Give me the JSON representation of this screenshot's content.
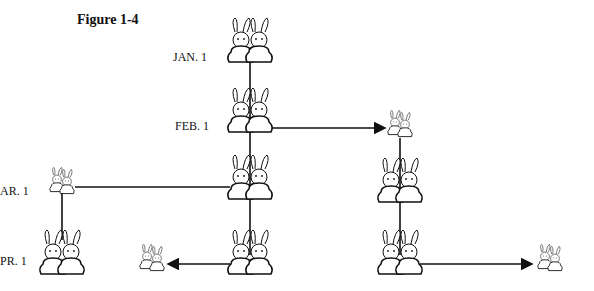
{
  "figure": {
    "title": "Figure 1-4",
    "labels": [
      "JAN. 1",
      "FEB. 1",
      "AR. 1",
      "PR. 1"
    ]
  },
  "nodes": [
    {
      "id": "jan-adult-pair",
      "x": 250,
      "y": 42,
      "type": "adult"
    },
    {
      "id": "feb-adult-pair",
      "x": 250,
      "y": 110,
      "type": "adult-mating"
    },
    {
      "id": "feb-baby-pair",
      "x": 400,
      "y": 128,
      "type": "baby"
    },
    {
      "id": "mar-adult-pair",
      "x": 250,
      "y": 175,
      "type": "adult-mating"
    },
    {
      "id": "mar-baby-pair",
      "x": 65,
      "y": 187,
      "type": "baby"
    },
    {
      "id": "mar-grown-pair",
      "x": 400,
      "y": 178,
      "type": "adult"
    },
    {
      "id": "apr-adult-pair-a",
      "x": 250,
      "y": 255,
      "type": "adult-mating"
    },
    {
      "id": "apr-grown-pair-left",
      "x": 62,
      "y": 252,
      "type": "adult"
    },
    {
      "id": "apr-baby-pair-left",
      "x": 152,
      "y": 262,
      "type": "baby"
    },
    {
      "id": "apr-adult-pair-b",
      "x": 400,
      "y": 255,
      "type": "adult-mating"
    },
    {
      "id": "apr-baby-pair-right",
      "x": 550,
      "y": 262,
      "type": "baby"
    }
  ]
}
